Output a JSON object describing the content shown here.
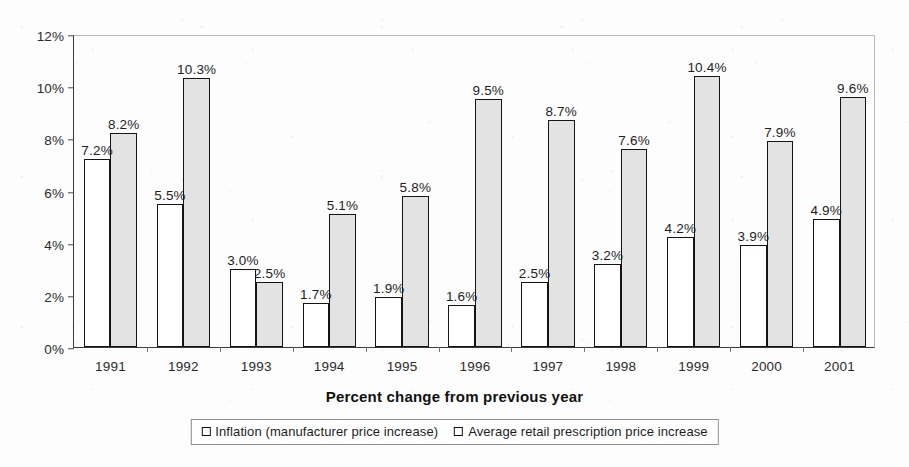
{
  "chart_data": {
    "type": "bar",
    "title": "",
    "xlabel": "Percent change from previous year",
    "ylabel": "",
    "categories": [
      "1991",
      "1992",
      "1993",
      "1994",
      "1995",
      "1996",
      "1997",
      "1998",
      "1999",
      "2000",
      "2001"
    ],
    "ylim": [
      0,
      12
    ],
    "y_ticks": [
      0,
      2,
      4,
      6,
      8,
      10,
      12
    ],
    "y_tick_labels": [
      "0%",
      "2%",
      "4%",
      "6%",
      "8%",
      "10%",
      "12%"
    ],
    "grid": false,
    "legend_position": "bottom",
    "series": [
      {
        "name": "Inflation (manufacturer price increase)",
        "color": "#ffffff",
        "border_color": "#141414",
        "values": [
          7.2,
          5.5,
          3.0,
          1.7,
          1.9,
          1.6,
          2.5,
          3.2,
          4.2,
          3.9,
          4.9
        ],
        "labels": [
          "7.2%",
          "5.5%",
          "3.0%",
          "1.7%",
          "1.9%",
          "1.6%",
          "2.5%",
          "3.2%",
          "4.2%",
          "3.9%",
          "4.9%"
        ]
      },
      {
        "name": "Average retail prescription price increase",
        "color": "#e3e3e3",
        "border_color": "#141414",
        "values": [
          8.2,
          10.3,
          2.5,
          5.1,
          5.8,
          9.5,
          8.7,
          7.6,
          10.4,
          7.9,
          9.6
        ],
        "labels": [
          "8.2%",
          "10.3%",
          "2.5%",
          "5.1%",
          "5.8%",
          "9.5%",
          "8.7%",
          "7.6%",
          "10.4%",
          "7.9%",
          "9.6%"
        ]
      }
    ]
  },
  "legend": {
    "items": [
      {
        "label": "Inflation (manufacturer price increase)",
        "swatch": "series-a"
      },
      {
        "label": "Average retail prescription price increase",
        "swatch": "series-b"
      }
    ]
  }
}
